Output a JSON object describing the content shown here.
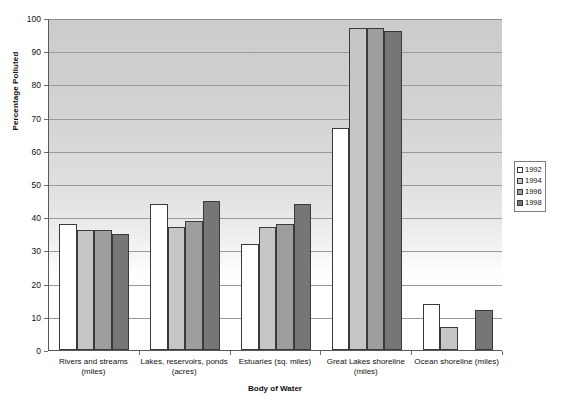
{
  "chart_data": {
    "type": "bar",
    "title": "",
    "xlabel": "Body of Water",
    "ylabel": "Percentage Polluted",
    "ylim": [
      0,
      100
    ],
    "ytick_step": 10,
    "yticks": [
      "0",
      "10",
      "20",
      "30",
      "40",
      "50",
      "60",
      "70",
      "80",
      "90",
      "100"
    ],
    "grid": true,
    "legend_position": "right",
    "categories": [
      "Rivers and streams (miles)",
      "Lakes, reservoirs, ponds (acres)",
      "Estuaries (sq. miles)",
      "Great Lakes shoreline (miles)",
      "Ocean shoreline (miles)"
    ],
    "category_lines": [
      [
        "Rivers and streams",
        "(miles)"
      ],
      [
        "Lakes, reservoirs, ponds",
        "(acres)"
      ],
      [
        "Estuaries (sq. miles)",
        ""
      ],
      [
        "Great Lakes shoreline",
        "(miles)"
      ],
      [
        "Ocean shoreline (miles)",
        ""
      ]
    ],
    "series": [
      {
        "name": "1992",
        "color": "#ffffff",
        "values": [
          38,
          44,
          32,
          67,
          14
        ]
      },
      {
        "name": "1994",
        "color": "#c6c6c6",
        "values": [
          36,
          37,
          37,
          97,
          7
        ]
      },
      {
        "name": "1996",
        "color": "#9e9e9e",
        "values": [
          36,
          39,
          38,
          97,
          0
        ]
      },
      {
        "name": "1998",
        "color": "#767676",
        "values": [
          35,
          45,
          44,
          96,
          12
        ]
      }
    ]
  },
  "legend": {
    "entries": [
      "1992",
      "1994",
      "1996",
      "1998"
    ]
  },
  "axes": {
    "y_title": "Percentage Polluted",
    "x_title": "Body of Water"
  }
}
